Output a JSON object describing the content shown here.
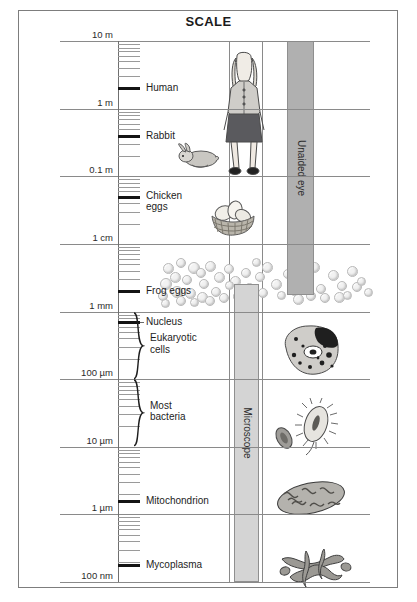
{
  "title": "SCALE",
  "axis": {
    "name": "logarithmic-length-scale",
    "top_value": "10 m",
    "bottom_value": "100 nm",
    "decades": [
      {
        "label": "10 m",
        "exp": 1
      },
      {
        "label": "1 m",
        "exp": 0
      },
      {
        "label": "0.1 m",
        "exp": -1
      },
      {
        "label": "1 cm",
        "exp": -2
      },
      {
        "label": "1 mm",
        "exp": -3
      },
      {
        "label": "100 µm",
        "exp": -4
      },
      {
        "label": "10 µm",
        "exp": -5
      },
      {
        "label": "1 µm",
        "exp": -6
      },
      {
        "label": "100 nm",
        "exp": -7
      }
    ]
  },
  "items": [
    {
      "label": "Human",
      "value": "2 m",
      "exp": 0.3
    },
    {
      "label": "Rabbit",
      "value": "0.4 m",
      "exp": -0.4
    },
    {
      "label": "Chicken eggs",
      "value": "5 cm",
      "exp": -1.3
    },
    {
      "label": "Frog eggs",
      "value": "2 mm",
      "exp": -2.7
    },
    {
      "label": "Nucleus",
      "value": "5 µm",
      "exp": -3.15
    },
    {
      "label": "Mitochondrion",
      "value": "1.5 µm",
      "exp": -5.8
    },
    {
      "label": "Mycoplasma",
      "value": "200 nm",
      "exp": -6.75
    }
  ],
  "brackets": [
    {
      "label": "Eukaryotic cells",
      "from_exp": -3.0,
      "to_exp": -4.0
    },
    {
      "label": "Most bacteria",
      "from_exp": -4.0,
      "to_exp": -5.0
    }
  ],
  "range_bars": [
    {
      "label": "Unaided eye",
      "from_exp": 1.0,
      "to_exp": -2.75,
      "color": "#b0b0b0"
    },
    {
      "label": "Microscope",
      "from_exp": -2.6,
      "to_exp": -7.0,
      "color": "#d4d4d4"
    }
  ],
  "illustrations": [
    {
      "name": "human-figure",
      "for": "Human"
    },
    {
      "name": "rabbit-figure",
      "for": "Rabbit"
    },
    {
      "name": "chicken-eggs-basket",
      "for": "Chicken eggs"
    },
    {
      "name": "frog-eggs-cluster",
      "for": "Frog eggs"
    },
    {
      "name": "eukaryotic-cell",
      "for": "Eukaryotic cells"
    },
    {
      "name": "bacteria-figure",
      "for": "Most bacteria"
    },
    {
      "name": "mitochondrion-figure",
      "for": "Mitochondrion"
    },
    {
      "name": "mycoplasma-figure",
      "for": "Mycoplasma"
    }
  ],
  "colors": {
    "frame": "#7d7d7d",
    "gridline": "#8a8a8a",
    "text": "#1d1d1d",
    "unaided_eye_bar": "#b0b0b0",
    "microscope_bar": "#d4d4d4"
  }
}
